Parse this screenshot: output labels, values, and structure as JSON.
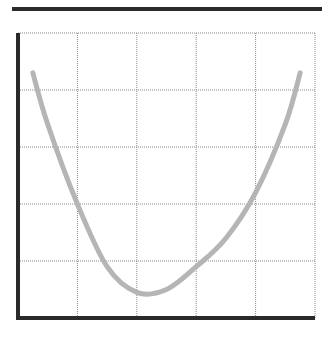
{
  "chart_data": {
    "type": "line",
    "title": "",
    "xlabel": "",
    "ylabel": "",
    "grid": true,
    "legend": null,
    "grid_divisions": {
      "x": 5,
      "y": 5
    },
    "xlim": [
      0,
      5
    ],
    "ylim": [
      0,
      5
    ],
    "series": [
      {
        "name": "curve",
        "color": "#b5b5b5",
        "x": [
          0.25,
          0.5,
          1.0,
          1.5,
          2.0,
          2.5,
          3.0,
          3.5,
          4.0,
          4.5,
          4.75
        ],
        "values": [
          4.3,
          3.4,
          2.0,
          0.9,
          0.45,
          0.5,
          0.9,
          1.4,
          2.2,
          3.4,
          4.3
        ]
      }
    ]
  },
  "colors": {
    "axis": "#2a2a2a",
    "grid": "#8a8a8a",
    "curve": "#b5b5b5",
    "background": "#ffffff"
  }
}
